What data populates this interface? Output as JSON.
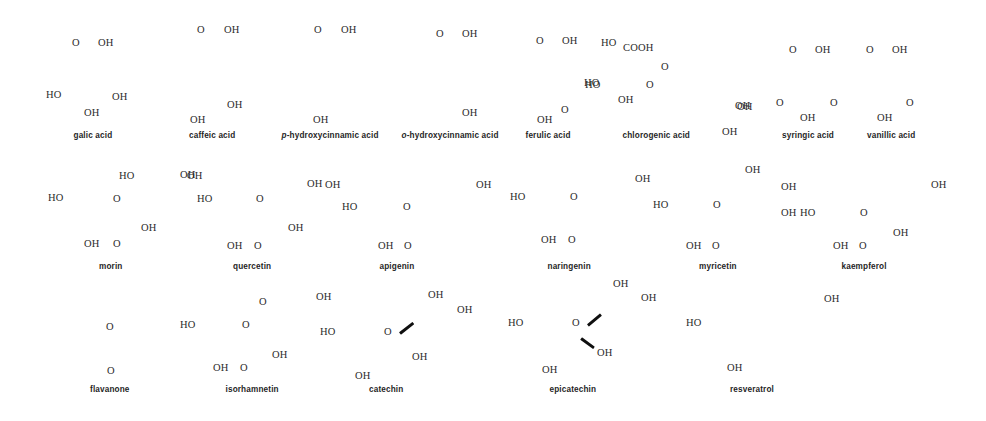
{
  "figure": {
    "width": 986,
    "height": 421,
    "background_color": "#ffffff",
    "label_color": "#2b2b2b",
    "caption_color": "#1f1f1f",
    "wedge_color": "#101010",
    "note": "Line-drawn skeletal structures; bond lines are not rendered, only heteroatom labels, two stereo wedge bonds, and compound captions are visible.",
    "rows": 3,
    "compound_count": 19
  },
  "compounds": [
    {
      "name": "galic acid",
      "name_prefix": "",
      "row": 1,
      "cx": 93,
      "cy": 132
    },
    {
      "name": "caffeic acid",
      "name_prefix": "",
      "row": 1,
      "cx": 212,
      "cy": 132
    },
    {
      "name": "hydroxycinnamic acid",
      "name_prefix": "p",
      "row": 1,
      "cx": 330,
      "cy": 132
    },
    {
      "name": "hydroxycinnamic acid",
      "name_prefix": "o",
      "row": 1,
      "cx": 450,
      "cy": 132
    },
    {
      "name": "ferulic acid",
      "name_prefix": "",
      "row": 1,
      "cx": 548,
      "cy": 132
    },
    {
      "name": "chlorogenic acid",
      "name_prefix": "",
      "row": 1,
      "cx": 656,
      "cy": 132
    },
    {
      "name": "syringic acid",
      "name_prefix": "",
      "row": 1,
      "cx": 808,
      "cy": 132
    },
    {
      "name": "vanillic acid",
      "name_prefix": "",
      "row": 1,
      "cx": 891,
      "cy": 132
    },
    {
      "name": "morin",
      "name_prefix": "",
      "row": 2,
      "cx": 111,
      "cy": 263
    },
    {
      "name": "quercetin",
      "name_prefix": "",
      "row": 2,
      "cx": 252,
      "cy": 263
    },
    {
      "name": "apigenin",
      "name_prefix": "",
      "row": 2,
      "cx": 397,
      "cy": 263
    },
    {
      "name": "naringenin",
      "name_prefix": "",
      "row": 2,
      "cx": 569,
      "cy": 263
    },
    {
      "name": "myricetin",
      "name_prefix": "",
      "row": 2,
      "cx": 718,
      "cy": 263
    },
    {
      "name": "kaempferol",
      "name_prefix": "",
      "row": 2,
      "cx": 864,
      "cy": 263
    },
    {
      "name": "flavanone",
      "name_prefix": "",
      "row": 3,
      "cx": 110,
      "cy": 386
    },
    {
      "name": "isorhamnetin",
      "name_prefix": "",
      "row": 3,
      "cx": 252,
      "cy": 386
    },
    {
      "name": "catechin",
      "name_prefix": "",
      "row": 3,
      "cx": 386,
      "cy": 386
    },
    {
      "name": "epicatechin",
      "name_prefix": "",
      "row": 3,
      "cx": 573,
      "cy": 386
    },
    {
      "name": "resveratrol",
      "name_prefix": "",
      "row": 3,
      "cx": 752,
      "cy": 386
    }
  ],
  "atom_labels": [
    {
      "text": "O",
      "x": 72,
      "y": 38,
      "compound": "galic acid"
    },
    {
      "text": "OH",
      "x": 98,
      "y": 38,
      "compound": "galic acid"
    },
    {
      "text": "HO",
      "x": 46,
      "y": 90,
      "compound": "galic acid"
    },
    {
      "text": "OH",
      "x": 112,
      "y": 92,
      "compound": "galic acid"
    },
    {
      "text": "OH",
      "x": 84,
      "y": 108,
      "compound": "galic acid"
    },
    {
      "text": "O",
      "x": 197,
      "y": 25,
      "compound": "caffeic acid"
    },
    {
      "text": "OH",
      "x": 224,
      "y": 25,
      "compound": "caffeic acid"
    },
    {
      "text": "OH",
      "x": 227,
      "y": 100,
      "compound": "caffeic acid"
    },
    {
      "text": "OH",
      "x": 190,
      "y": 115,
      "compound": "caffeic acid"
    },
    {
      "text": "O",
      "x": 314,
      "y": 25,
      "compound": "p-hydroxycinnamic acid"
    },
    {
      "text": "OH",
      "x": 341,
      "y": 25,
      "compound": "p-hydroxycinnamic acid"
    },
    {
      "text": "OH",
      "x": 313,
      "y": 115,
      "compound": "p-hydroxycinnamic acid"
    },
    {
      "text": "O",
      "x": 436,
      "y": 29,
      "compound": "o-hydroxycinnamic acid"
    },
    {
      "text": "OH",
      "x": 462,
      "y": 29,
      "compound": "o-hydroxycinnamic acid"
    },
    {
      "text": "OH",
      "x": 462,
      "y": 108,
      "compound": "o-hydroxycinnamic acid"
    },
    {
      "text": "O",
      "x": 536,
      "y": 36,
      "compound": "ferulic acid"
    },
    {
      "text": "OH",
      "x": 562,
      "y": 36,
      "compound": "ferulic acid"
    },
    {
      "text": "HO",
      "x": 584,
      "y": 78,
      "compound": "ferulic acid"
    },
    {
      "text": "O",
      "x": 561,
      "y": 105,
      "compound": "ferulic acid"
    },
    {
      "text": "OH",
      "x": 537,
      "y": 115,
      "compound": "ferulic acid"
    },
    {
      "text": "HO",
      "x": 601,
      "y": 38,
      "compound": "chlorogenic acid"
    },
    {
      "text": "COOH",
      "x": 623,
      "y": 43,
      "compound": "chlorogenic acid"
    },
    {
      "text": "O",
      "x": 661,
      "y": 62,
      "compound": "chlorogenic acid"
    },
    {
      "text": "HO",
      "x": 585,
      "y": 80,
      "compound": "chlorogenic acid"
    },
    {
      "text": "O",
      "x": 646,
      "y": 80,
      "compound": "chlorogenic acid"
    },
    {
      "text": "OH",
      "x": 618,
      "y": 95,
      "compound": "chlorogenic acid"
    },
    {
      "text": "OH",
      "x": 737,
      "y": 102,
      "compound": "chlorogenic acid"
    },
    {
      "text": "OH",
      "x": 722,
      "y": 127,
      "compound": "chlorogenic acid"
    },
    {
      "text": "O",
      "x": 789,
      "y": 45,
      "compound": "syringic acid"
    },
    {
      "text": "OH",
      "x": 815,
      "y": 45,
      "compound": "syringic acid"
    },
    {
      "text": "OH",
      "x": 735,
      "y": 101,
      "compound": "syringic acid"
    },
    {
      "text": "O",
      "x": 776,
      "y": 98,
      "compound": "syringic acid"
    },
    {
      "text": "O",
      "x": 830,
      "y": 98,
      "compound": "syringic acid"
    },
    {
      "text": "OH",
      "x": 800,
      "y": 113,
      "compound": "syringic acid"
    },
    {
      "text": "O",
      "x": 866,
      "y": 45,
      "compound": "vanillic acid"
    },
    {
      "text": "OH",
      "x": 892,
      "y": 45,
      "compound": "vanillic acid"
    },
    {
      "text": "O",
      "x": 906,
      "y": 98,
      "compound": "vanillic acid"
    },
    {
      "text": "OH",
      "x": 877,
      "y": 113,
      "compound": "vanillic acid"
    },
    {
      "text": "HO",
      "x": 119,
      "y": 171,
      "compound": "morin"
    },
    {
      "text": "OH",
      "x": 180,
      "y": 170,
      "compound": "morin"
    },
    {
      "text": "HO",
      "x": 48,
      "y": 193,
      "compound": "morin"
    },
    {
      "text": "O",
      "x": 113,
      "y": 194,
      "compound": "morin"
    },
    {
      "text": "OH",
      "x": 141,
      "y": 223,
      "compound": "morin"
    },
    {
      "text": "OH",
      "x": 84,
      "y": 239,
      "compound": "morin"
    },
    {
      "text": "O",
      "x": 113,
      "y": 239,
      "compound": "morin"
    },
    {
      "text": "OH",
      "x": 187,
      "y": 171,
      "compound": "quercetin"
    },
    {
      "text": "OH",
      "x": 325,
      "y": 180,
      "compound": "quercetin"
    },
    {
      "text": "HO",
      "x": 197,
      "y": 194,
      "compound": "quercetin"
    },
    {
      "text": "O",
      "x": 256,
      "y": 194,
      "compound": "quercetin"
    },
    {
      "text": "OH",
      "x": 288,
      "y": 223,
      "compound": "quercetin"
    },
    {
      "text": "OH",
      "x": 227,
      "y": 241,
      "compound": "quercetin"
    },
    {
      "text": "O",
      "x": 254,
      "y": 241,
      "compound": "quercetin"
    },
    {
      "text": "OH",
      "x": 307,
      "y": 179,
      "compound": "apigenin"
    },
    {
      "text": "HO",
      "x": 342,
      "y": 202,
      "compound": "apigenin"
    },
    {
      "text": "O",
      "x": 403,
      "y": 202,
      "compound": "apigenin"
    },
    {
      "text": "OH",
      "x": 476,
      "y": 180,
      "compound": "apigenin"
    },
    {
      "text": "OH",
      "x": 378,
      "y": 241,
      "compound": "apigenin"
    },
    {
      "text": "O",
      "x": 404,
      "y": 241,
      "compound": "apigenin"
    },
    {
      "text": "HO",
      "x": 510,
      "y": 192,
      "compound": "naringenin"
    },
    {
      "text": "O",
      "x": 570,
      "y": 192,
      "compound": "naringenin"
    },
    {
      "text": "OH",
      "x": 541,
      "y": 235,
      "compound": "naringenin"
    },
    {
      "text": "O",
      "x": 568,
      "y": 235,
      "compound": "naringenin"
    },
    {
      "text": "OH",
      "x": 635,
      "y": 174,
      "compound": "myricetin"
    },
    {
      "text": "HO",
      "x": 653,
      "y": 200,
      "compound": "myricetin"
    },
    {
      "text": "O",
      "x": 713,
      "y": 200,
      "compound": "myricetin"
    },
    {
      "text": "OH",
      "x": 745,
      "y": 165,
      "compound": "myricetin"
    },
    {
      "text": "OH",
      "x": 781,
      "y": 182,
      "compound": "myricetin"
    },
    {
      "text": "OH",
      "x": 781,
      "y": 208,
      "compound": "myricetin"
    },
    {
      "text": "OH",
      "x": 686,
      "y": 241,
      "compound": "myricetin"
    },
    {
      "text": "O",
      "x": 712,
      "y": 241,
      "compound": "myricetin"
    },
    {
      "text": "HO",
      "x": 800,
      "y": 208,
      "compound": "kaempferol"
    },
    {
      "text": "O",
      "x": 860,
      "y": 208,
      "compound": "kaempferol"
    },
    {
      "text": "OH",
      "x": 931,
      "y": 180,
      "compound": "kaempferol"
    },
    {
      "text": "OH",
      "x": 893,
      "y": 228,
      "compound": "kaempferol"
    },
    {
      "text": "OH",
      "x": 833,
      "y": 241,
      "compound": "kaempferol"
    },
    {
      "text": "O",
      "x": 859,
      "y": 241,
      "compound": "kaempferol"
    },
    {
      "text": "O",
      "x": 106,
      "y": 322,
      "compound": "flavanone"
    },
    {
      "text": "O",
      "x": 107,
      "y": 366,
      "compound": "flavanone"
    },
    {
      "text": "O",
      "x": 259,
      "y": 297,
      "compound": "isorhamnetin"
    },
    {
      "text": "HO",
      "x": 180,
      "y": 320,
      "compound": "isorhamnetin"
    },
    {
      "text": "O",
      "x": 242,
      "y": 320,
      "compound": "isorhamnetin"
    },
    {
      "text": "OH",
      "x": 272,
      "y": 350,
      "compound": "isorhamnetin"
    },
    {
      "text": "OH",
      "x": 213,
      "y": 363,
      "compound": "isorhamnetin"
    },
    {
      "text": "O",
      "x": 240,
      "y": 363,
      "compound": "isorhamnetin"
    },
    {
      "text": "OH",
      "x": 428,
      "y": 290,
      "compound": "catechin"
    },
    {
      "text": "OH",
      "x": 457,
      "y": 305,
      "compound": "catechin"
    },
    {
      "text": "OH",
      "x": 316,
      "y": 292,
      "compound": "catechin"
    },
    {
      "text": "HO",
      "x": 320,
      "y": 327,
      "compound": "catechin"
    },
    {
      "text": "O",
      "x": 384,
      "y": 327,
      "compound": "catechin"
    },
    {
      "text": "OH",
      "x": 412,
      "y": 352,
      "compound": "catechin"
    },
    {
      "text": "OH",
      "x": 355,
      "y": 371,
      "compound": "catechin"
    },
    {
      "text": "OH",
      "x": 613,
      "y": 279,
      "compound": "epicatechin"
    },
    {
      "text": "OH",
      "x": 641,
      "y": 293,
      "compound": "epicatechin"
    },
    {
      "text": "HO",
      "x": 508,
      "y": 318,
      "compound": "epicatechin"
    },
    {
      "text": "O",
      "x": 572,
      "y": 318,
      "compound": "epicatechin"
    },
    {
      "text": "OH",
      "x": 597,
      "y": 348,
      "compound": "epicatechin"
    },
    {
      "text": "OH",
      "x": 542,
      "y": 365,
      "compound": "epicatechin"
    },
    {
      "text": "OH",
      "x": 824,
      "y": 294,
      "compound": "resveratrol"
    },
    {
      "text": "HO",
      "x": 686,
      "y": 318,
      "compound": "resveratrol"
    },
    {
      "text": "OH",
      "x": 727,
      "y": 363,
      "compound": "resveratrol"
    }
  ],
  "wedge_bonds": [
    {
      "compound": "catechin",
      "x": 400,
      "y": 332,
      "length": 17,
      "angle": -38,
      "thickness": 3.2
    },
    {
      "compound": "epicatechin",
      "x": 588,
      "y": 324,
      "length": 17,
      "angle": -40,
      "thickness": 3.2
    },
    {
      "compound": "epicatechin",
      "x": 581,
      "y": 337,
      "length": 16,
      "angle": 36,
      "thickness": 3.2
    }
  ]
}
